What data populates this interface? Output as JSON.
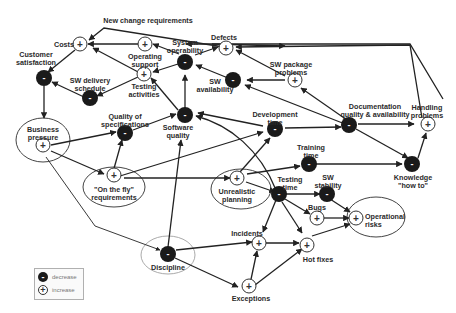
{
  "diagram": {
    "type": "causal-loop",
    "colors": {
      "decrease_node": "#1a1a1a",
      "increase_node": "#ffffff",
      "edge": "#222222",
      "ellipse": "#333333",
      "discipline_ellipse": "#aaaaaa"
    },
    "nodes": [
      {
        "id": "costs",
        "label": "Costs",
        "sign": "+"
      },
      {
        "id": "customer_satisfaction",
        "label": "Customer\nsatisfaction",
        "sign": "-"
      },
      {
        "id": "operating_support",
        "label": "Operating\nsupport",
        "sign": "+"
      },
      {
        "id": "system_operability",
        "label": "System\noperability",
        "sign": "-"
      },
      {
        "id": "defects",
        "label": "Defects",
        "sign": "+"
      },
      {
        "id": "testing_activities",
        "label": "Testing\nactivities",
        "sign": "+"
      },
      {
        "id": "sw_delivery_schedule",
        "label": "SW delivery\nschedule",
        "sign": "-"
      },
      {
        "id": "sw_availability",
        "label": "SW\navailability",
        "sign": "-"
      },
      {
        "id": "sw_package_problems",
        "label": "SW package\nproblems",
        "sign": "+"
      },
      {
        "id": "business_pressure",
        "label": "Business\npressure",
        "sign": "+"
      },
      {
        "id": "quality_of_specifications",
        "label": "Quality of\nspecifications",
        "sign": "-"
      },
      {
        "id": "software_quality",
        "label": "Software\nquality",
        "sign": "-"
      },
      {
        "id": "development_time",
        "label": "Development\ntime",
        "sign": "-"
      },
      {
        "id": "documentation_quality",
        "label": "Documentation\nquality & availability",
        "sign": "-"
      },
      {
        "id": "handling_problems",
        "label": "Handling\nproblems",
        "sign": "+"
      },
      {
        "id": "on_the_fly_requirements",
        "label": "\"On the fly\"\nrequirements",
        "sign": "+"
      },
      {
        "id": "unrealistic_planning",
        "label": "Unrealistic\nplanning",
        "sign": "+"
      },
      {
        "id": "training_time",
        "label": "Training\ntime",
        "sign": "-"
      },
      {
        "id": "knowledge_how_to",
        "label": "Knowledge\n\"how to\"",
        "sign": "-"
      },
      {
        "id": "testing_time",
        "label": "Testing\ntime",
        "sign": "-"
      },
      {
        "id": "sw_stability",
        "label": "SW\nstability",
        "sign": "-"
      },
      {
        "id": "bugs",
        "label": "Bugs",
        "sign": "+"
      },
      {
        "id": "operational_risks",
        "label": "Operational\nrisks",
        "sign": "+"
      },
      {
        "id": "incidents",
        "label": "Incidents",
        "sign": "+"
      },
      {
        "id": "hot_fixes",
        "label": "Hot fixes",
        "sign": "+"
      },
      {
        "id": "exceptions",
        "label": "Exceptions",
        "sign": "+"
      },
      {
        "id": "discipline",
        "label": "Discipline",
        "sign": "-"
      }
    ],
    "edge_labels": {
      "new_change_requirements": "New change requirements"
    },
    "legend": [
      {
        "sign": "-",
        "label": "decrease"
      },
      {
        "sign": "+",
        "label": "increase"
      }
    ]
  }
}
